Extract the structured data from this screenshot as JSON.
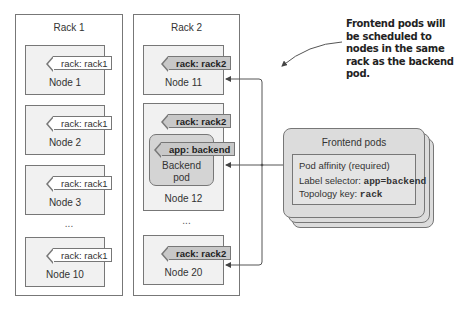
{
  "racks": [
    {
      "title": "Rack 1",
      "nodes": [
        {
          "label": "Node 1",
          "tag": "rack: rack1"
        },
        {
          "label": "Node 2",
          "tag": "rack: rack1"
        },
        {
          "label": "Node 3",
          "tag": "rack: rack1"
        },
        {
          "label": "Node 10",
          "tag": "rack: rack1"
        }
      ],
      "ellipsis": "..."
    },
    {
      "title": "Rack 2",
      "nodes": [
        {
          "label": "Node 11",
          "tag": "rack: rack2"
        },
        {
          "label": "Node 12",
          "tag": "rack: rack2"
        },
        {
          "label": "Node 20",
          "tag": "rack: rack2"
        }
      ],
      "ellipsis": "...",
      "backend_pod": {
        "tag": "app: backend",
        "label_line1": "Backend",
        "label_line2": "pod"
      }
    }
  ],
  "frontend": {
    "title": "Frontend pods",
    "rule_title": "Pod affinity (required)",
    "selector_label": "Label selector: ",
    "selector_value": "app=backend",
    "topology_label": "Topology key: ",
    "topology_value": "rack"
  },
  "annotation": "Frontend pods will be scheduled to nodes in the same rack as the backend pod.",
  "colors": {
    "border": "#777777",
    "node_bg": "#f1f1f1",
    "tag_dark_bg": "#c8c8c8",
    "pod_bg": "#d4d4d4",
    "frontend_bg": "#dcdcdc"
  }
}
